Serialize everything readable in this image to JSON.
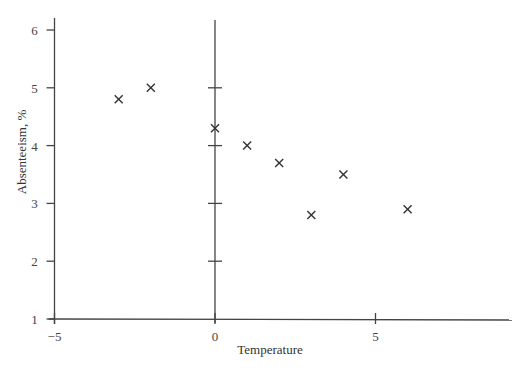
{
  "chart_data": {
    "type": "scatter",
    "title": "",
    "xlabel": "Temperature",
    "ylabel": "Absenteeism, %",
    "xlim": [
      -5,
      9.2
    ],
    "ylim": [
      1,
      6.5
    ],
    "x_ticks": [
      -5,
      0,
      5
    ],
    "x_tick_labels": [
      "−5",
      "0",
      "5"
    ],
    "y_ticks": [
      1,
      2,
      3,
      4,
      5,
      6
    ],
    "y_tick_labels": [
      "1",
      "2",
      "3",
      "4",
      "5",
      "6"
    ],
    "zero_axis_ticks": [
      2,
      3,
      4,
      5
    ],
    "grid": false,
    "legend": null,
    "marker": "x",
    "series": [
      {
        "name": "Absenteeism",
        "x": [
          -3,
          -2,
          0,
          1,
          2,
          3,
          4,
          6
        ],
        "y": [
          4.8,
          5.0,
          4.3,
          4.0,
          3.7,
          2.8,
          3.5,
          2.9
        ]
      }
    ]
  },
  "labels": {
    "xlabel": "Temperature",
    "ylabel": "Absenteeism, %"
  }
}
